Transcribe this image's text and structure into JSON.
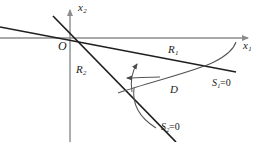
{
  "figure": {
    "kind": "line-diagram",
    "background": "#ffffff",
    "axis_color": "#8c8c8c",
    "line_color": "#1f1f1f",
    "curve_color": "#555555",
    "label_color": "#1a1a1a",
    "width": 260,
    "height": 142
  },
  "axes": {
    "x_axis": {
      "name": "x-axis",
      "label_base": "x",
      "label_sub": "1",
      "origin_x": 70,
      "origin_y": 38,
      "end_x": 252,
      "arrow": "right"
    },
    "y_axis": {
      "name": "y-axis",
      "label_base": "x",
      "label_sub": "2",
      "origin_x": 70,
      "top_y": 8,
      "bottom_y": 142,
      "arrow": "up"
    },
    "origin_label": "O"
  },
  "lines": [
    {
      "name": "s1-line",
      "label_base": "S",
      "label_sub": "1",
      "label_eq": "=0",
      "x1": 0,
      "y1": 27,
      "x2": 236,
      "y2": 72
    },
    {
      "name": "s2-line",
      "label_base": "S",
      "label_sub": "2",
      "label_eq": "=0",
      "x1": 53,
      "y1": 16,
      "x2": 176,
      "y2": 142
    }
  ],
  "regions": [
    {
      "name": "region-1",
      "label_base": "R",
      "label_sub": "1"
    },
    {
      "name": "region-2",
      "label_base": "R",
      "label_sub": "2"
    }
  ],
  "curve": {
    "name": "d-curve",
    "label": "D",
    "path": "M 118 93 C 150 82 196 71 214 62 C 228 55 234 48 236 42"
  },
  "leader": {
    "name": "s2-leader",
    "path": "M 134 88 C 132 104 140 118 156 128"
  },
  "arrows": [
    {
      "name": "up-arrow",
      "x": 137,
      "y": 62,
      "direction": "up"
    },
    {
      "name": "left-arrow",
      "x": 124,
      "y": 78,
      "direction": "left"
    }
  ]
}
